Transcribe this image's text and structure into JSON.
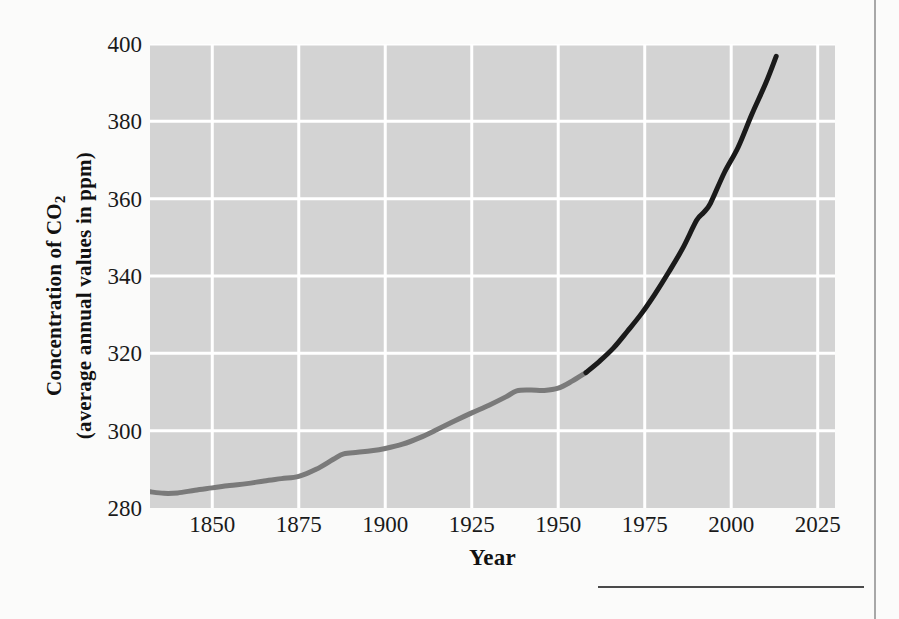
{
  "figure": {
    "x_axis_title": "Year",
    "y_axis_title_line1": "Concentration of CO",
    "y_axis_title_sub": "2",
    "y_axis_title_line2": "(average annual values in ppm)"
  },
  "colors": {
    "plot_background": "#d3d3d3",
    "gridline": "#ffffff",
    "page_background": "#fbfbfa",
    "ice_core_line": "#7a7a7a",
    "modern_line": "#1a1a1a",
    "tick_label": "#1a1a1a",
    "rule": "#4a4a4a",
    "page_border": "#a8a8a8"
  },
  "chart_data": {
    "type": "line",
    "title": "",
    "subtitle": "",
    "xlabel": "Year",
    "ylabel": "Concentration of CO2 (average annual values in ppm)",
    "xlim": [
      1832,
      2030
    ],
    "ylim": [
      280,
      400
    ],
    "xticks": [
      1850,
      1875,
      1900,
      1925,
      1950,
      1975,
      2000,
      2025
    ],
    "yticks": [
      280,
      300,
      320,
      340,
      360,
      380,
      400
    ],
    "xtick_labels": [
      "1850",
      "1875",
      "1900",
      "1925",
      "1950",
      "1975",
      "2000",
      "2025"
    ],
    "ytick_labels": [
      "280",
      "300",
      "320",
      "340",
      "360",
      "380",
      "400"
    ],
    "grid": true,
    "legend": "none",
    "series": [
      {
        "name": "Ice core record",
        "color": "#7a7a7a",
        "x": [
          1832,
          1836,
          1840,
          1845,
          1850,
          1855,
          1860,
          1865,
          1870,
          1875,
          1880,
          1885,
          1888,
          1892,
          1896,
          1900,
          1905,
          1910,
          1915,
          1920,
          1925,
          1930,
          1935,
          1938,
          1942,
          1946,
          1950,
          1954,
          1958
        ],
        "y": [
          284.2,
          283.8,
          283.9,
          284.6,
          285.2,
          285.8,
          286.3,
          287.0,
          287.6,
          288.2,
          290.0,
          292.6,
          294.0,
          294.4,
          294.8,
          295.4,
          296.5,
          298.2,
          300.3,
          302.5,
          304.6,
          306.6,
          308.8,
          310.3,
          310.5,
          310.4,
          311.0,
          312.8,
          315.0
        ]
      },
      {
        "name": "Direct measurements (Mauna Loa)",
        "color": "#1a1a1a",
        "x": [
          1958,
          1962,
          1966,
          1970,
          1974,
          1978,
          1982,
          1986,
          1990,
          1992,
          1994,
          1998,
          2002,
          2006,
          2010,
          2013
        ],
        "y": [
          315.0,
          318.0,
          321.4,
          325.7,
          330.2,
          335.4,
          341.1,
          347.2,
          354.4,
          356.4,
          358.8,
          366.7,
          373.3,
          381.9,
          389.9,
          396.8
        ]
      }
    ],
    "annotations": [
      {
        "text": "line shade changes from gray (ice core) to black (direct measurement) near 1958"
      }
    ]
  }
}
